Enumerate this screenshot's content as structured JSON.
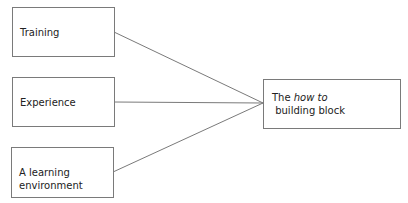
{
  "diagram": {
    "type": "convergence",
    "inputs": [
      {
        "label": "Training"
      },
      {
        "label": "Experience"
      },
      {
        "label": "A learning environment"
      }
    ],
    "output": {
      "label_before": "The ",
      "label_italic": "how to",
      "label_after": " building block",
      "full_label": "The how to building block"
    },
    "edges": [
      {
        "from": "Training",
        "to": "The how to building block"
      },
      {
        "from": "Experience",
        "to": "The how to building block"
      },
      {
        "from": "A learning environment",
        "to": "The how to building block"
      }
    ],
    "colors": {
      "stroke": "#7a7a7a",
      "text": "#222222",
      "background": "#ffffff"
    }
  }
}
